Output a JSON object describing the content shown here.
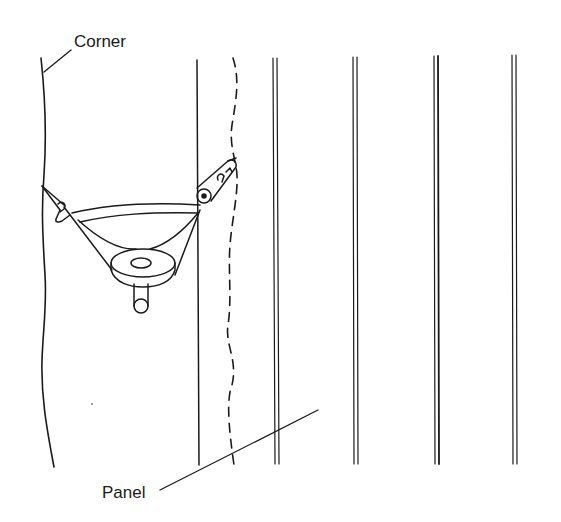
{
  "diagram": {
    "type": "technical-illustration",
    "labels": {
      "corner": "Corner",
      "panel": "Panel"
    },
    "colors": {
      "ink": "#1a1a1a",
      "background": "#ffffff"
    },
    "elements": [
      {
        "id": "corner-wall-line",
        "style": "solid-wavy"
      },
      {
        "id": "panel-edge-line",
        "style": "solid"
      },
      {
        "id": "scribe-mark-line",
        "style": "dashed-wavy"
      },
      {
        "id": "panel-grooves",
        "style": "double-line",
        "count": 4
      },
      {
        "id": "scriber-compass-tool",
        "parts": [
          "arc-bar",
          "pivot-disc",
          "handle",
          "pencil-holder",
          "point-leg"
        ]
      },
      {
        "id": "corner-leader-line"
      },
      {
        "id": "panel-leader-line"
      }
    ]
  }
}
